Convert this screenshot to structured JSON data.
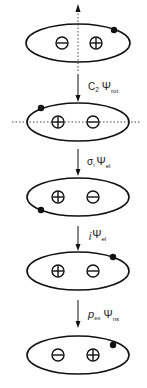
{
  "diagram": {
    "stroke_color": "#111111",
    "axis_color": "#444444",
    "states": [
      {
        "id": "state-1",
        "cy": 43,
        "left_sign": "minus",
        "right_sign": "plus",
        "dot": {
          "x": 114,
          "y": 30
        },
        "axis": "vertical"
      },
      {
        "id": "state-2",
        "cy": 122,
        "left_sign": "plus",
        "right_sign": "minus",
        "dot": {
          "x": 41,
          "y": 108
        },
        "axis": "horizontal"
      },
      {
        "id": "state-3",
        "cy": 197,
        "left_sign": "plus",
        "right_sign": "minus",
        "dot": {
          "x": 41,
          "y": 210
        },
        "axis": "none"
      },
      {
        "id": "state-4",
        "cy": 271,
        "left_sign": "plus",
        "right_sign": "minus",
        "dot": {
          "x": 113,
          "y": 257
        },
        "axis": "none"
      },
      {
        "id": "state-5",
        "cy": 355,
        "left_sign": "minus",
        "right_sign": "plus",
        "dot": {
          "x": 113,
          "y": 345
        },
        "axis": "none"
      }
    ],
    "operations": [
      {
        "id": "op-1",
        "operator": "C",
        "operator_sub": "2",
        "function": "Ψ",
        "function_sub": "rot"
      },
      {
        "id": "op-2",
        "operator": "σ",
        "operator_sub": "i",
        "function": "Ψ",
        "function_sub": "el"
      },
      {
        "id": "op-3",
        "operator": "i",
        "operator_sub": "",
        "function": "Ψ",
        "function_sub": "el"
      },
      {
        "id": "op-4",
        "operator": "p",
        "operator_sub": "ex",
        "function": "Ψ",
        "function_sub": "ns"
      }
    ]
  }
}
